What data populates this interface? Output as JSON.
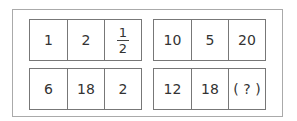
{
  "puzzle": {
    "groups": [
      {
        "rows": [
          {
            "cells": [
              "1",
              "2",
              {
                "numerator": "1",
                "denominator": "2"
              }
            ]
          },
          {
            "cells": [
              "6",
              "18",
              "2"
            ]
          }
        ]
      },
      {
        "rows": [
          {
            "cells": [
              "10",
              "5",
              "20"
            ]
          },
          {
            "cells": [
              "12",
              "18",
              "( ? )"
            ]
          }
        ]
      }
    ]
  }
}
